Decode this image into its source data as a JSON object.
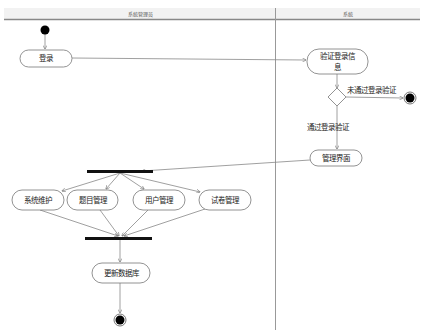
{
  "diagram": {
    "type": "UML activity diagram with swimlanes",
    "swimlanes": [
      {
        "id": "admin",
        "label": "系统管理员"
      },
      {
        "id": "system",
        "label": "系统"
      }
    ],
    "nodes": {
      "start": {
        "kind": "initial"
      },
      "login": {
        "kind": "action",
        "label": "登录",
        "lane": "admin"
      },
      "verify": {
        "kind": "action",
        "label_line1": "验证登录信",
        "label_line2": "息",
        "lane": "system"
      },
      "decision": {
        "kind": "decision",
        "lane": "system"
      },
      "end_fail": {
        "kind": "final",
        "lane": "system"
      },
      "admin_ui": {
        "kind": "action",
        "label": "管理界面",
        "lane": "system"
      },
      "fork": {
        "kind": "fork",
        "lane": "admin"
      },
      "sys_maint": {
        "kind": "action",
        "label": "系统维护",
        "lane": "admin"
      },
      "question_mgmt": {
        "kind": "action",
        "label": "题目管理",
        "lane": "admin"
      },
      "user_mgmt": {
        "kind": "action",
        "label": "用户管理",
        "lane": "admin"
      },
      "paper_mgmt": {
        "kind": "action",
        "label": "试卷管理",
        "lane": "admin"
      },
      "join": {
        "kind": "join",
        "lane": "admin"
      },
      "update_db": {
        "kind": "action",
        "label": "更新数据库",
        "lane": "admin"
      },
      "end": {
        "kind": "final",
        "lane": "admin"
      }
    },
    "edges": {
      "fail_label": "未通过登录验证",
      "pass_label": "通过登录验证"
    }
  }
}
